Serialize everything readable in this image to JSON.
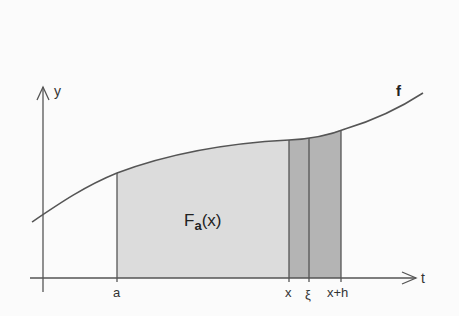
{
  "diagram": {
    "axes": {
      "x_label": "t",
      "y_label": "y"
    },
    "function_label": "f",
    "area_label": {
      "main": "F",
      "subscript": "a",
      "argument": "(x)"
    },
    "ticks": [
      {
        "label": "a",
        "x": 117
      },
      {
        "label": "x",
        "x": 289
      },
      {
        "label": "ξ",
        "x": 309
      },
      {
        "label": "x+h",
        "x": 341
      }
    ],
    "colors": {
      "background": "#fbfbfb",
      "line": "#555555",
      "light_fill": "#dcdcdc",
      "dark_fill": "#b4b4b4"
    }
  }
}
